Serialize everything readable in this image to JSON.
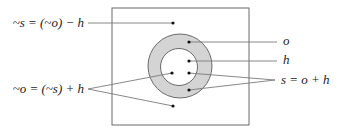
{
  "diagram": {
    "colors": {
      "stroke": "#6b6b6b",
      "ring_fill": "#d4d4d4",
      "inner_fill": "#ffffff",
      "dot": "#111111",
      "leader": "#7a7a7a",
      "text": "#222222"
    },
    "box": {
      "x": 112,
      "y": 8,
      "width": 137,
      "height": 117
    },
    "outer_circle": {
      "cx": 180,
      "cy": 66,
      "r": 32,
      "label": "o"
    },
    "inner_circle": {
      "cx": 179,
      "cy": 67,
      "r": 18.5,
      "label": "h"
    },
    "labels": {
      "not_s": "~s = (~o) − h",
      "not_o": "~o = (~s) + h",
      "o": "o",
      "h": "h",
      "s": "s = o + h"
    },
    "points": {
      "not_s_dot": {
        "x": 173,
        "y": 23
      },
      "o_dot": {
        "x": 189,
        "y": 42
      },
      "h_dot": {
        "x": 189,
        "y": 61
      },
      "not_o_inner_dot": {
        "x": 172,
        "y": 73
      },
      "s_inner_dot": {
        "x": 189,
        "y": 73
      },
      "s_ring_dot": {
        "x": 189,
        "y": 90
      },
      "not_o_outer_dot": {
        "x": 173,
        "y": 106
      }
    }
  }
}
